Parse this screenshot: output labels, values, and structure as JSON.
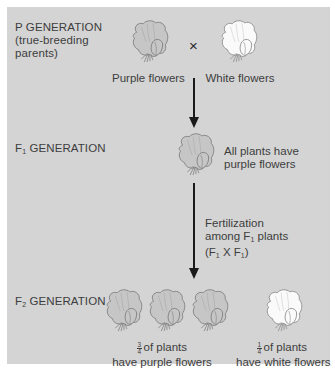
{
  "colors": {
    "panel_bg": "#d4d4d4",
    "page_bg": "#ffffff",
    "purple_flower_fill": "#c6c6c6",
    "white_flower_fill": "#fafafa",
    "outline": "#7d7d7d",
    "arrow": "#1a1a1a",
    "text": "#3d3d3d"
  },
  "p_generation": {
    "label_line1": "P GENERATION",
    "label_line2": "(true-breeding",
    "label_line3": "parents)",
    "cross_symbol": "×",
    "parent_purple": {
      "icon": "purple-flower-icon",
      "caption": "Purple flowers"
    },
    "parent_white": {
      "icon": "white-flower-icon",
      "caption": "White flowers"
    }
  },
  "f1_generation": {
    "label_prefix": "F",
    "label_sub": "1",
    "label_suffix": " GENERATION",
    "flower_icon": "purple-flower-icon",
    "caption_line1": "All plants have",
    "caption_line2": "purple flowers"
  },
  "fertilization": {
    "line1": "Fertilization",
    "line2_prefix": "among F",
    "line2_sub": "1",
    "line2_suffix": " plants",
    "line3_a": "(F",
    "line3_sub1": "1",
    "line3_mid": " X F",
    "line3_sub2": "1",
    "line3_end": ")"
  },
  "f2_generation": {
    "label_prefix": "F",
    "label_sub": "2",
    "label_suffix": " GENERATION",
    "purple_count": 3,
    "white_count": 1,
    "purple_caption": {
      "frac_num": "3",
      "frac_den": "4",
      "line1_rest": "of plants",
      "line2": "have purple flowers"
    },
    "white_caption": {
      "frac_num": "1",
      "frac_den": "4",
      "line1_rest": "of plants",
      "line2": "have white flowers"
    }
  }
}
